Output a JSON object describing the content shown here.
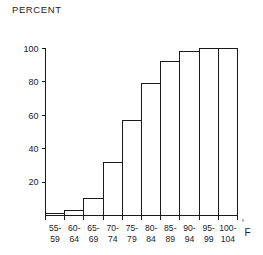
{
  "chart_data": {
    "type": "bar",
    "title": "",
    "ylabel": "PERCENT",
    "xlabel": "",
    "unit_degree": "°",
    "unit_label": "F",
    "categories": [
      "55-59",
      "60-64",
      "65-69",
      "70-74",
      "75-79",
      "80-84",
      "85-89",
      "90-94",
      "95-99",
      "100-104"
    ],
    "category_lines": [
      [
        "55-",
        "59"
      ],
      [
        "60-",
        "64"
      ],
      [
        "65-",
        "69"
      ],
      [
        "70-",
        "74"
      ],
      [
        "75-",
        "79"
      ],
      [
        "80-",
        "84"
      ],
      [
        "85-",
        "89"
      ],
      [
        "90-",
        "94"
      ],
      [
        "95-",
        "99"
      ],
      [
        "100-",
        "104"
      ]
    ],
    "values": [
      1,
      3,
      10,
      32,
      57,
      79,
      92,
      98,
      100,
      100
    ],
    "ylim": [
      0,
      100
    ],
    "yticks": [
      20,
      40,
      60,
      80,
      100
    ],
    "ytick_labels": [
      "20",
      "40",
      "60",
      "80",
      "100"
    ],
    "grid": false,
    "legend": null,
    "bar_fill": "#ffffff",
    "bar_stroke": "#1a1a1a",
    "background": "#ffffff"
  }
}
